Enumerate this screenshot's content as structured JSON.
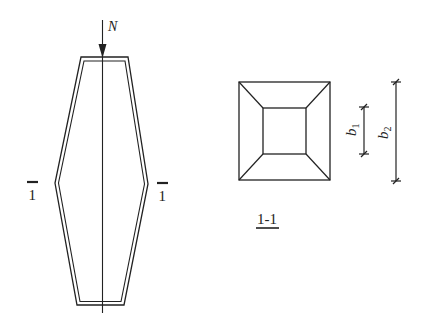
{
  "diagram": {
    "type": "structural-column-with-cross-section",
    "elevation": {
      "load_label": "N",
      "section_mark_left": "1",
      "section_mark_right": "1"
    },
    "section": {
      "title": "1-1",
      "dimensions": [
        {
          "label": "b",
          "subscript": "1",
          "describes": "inner square side"
        },
        {
          "label": "b",
          "subscript": "2",
          "describes": "outer square side"
        }
      ]
    },
    "colors": {
      "line": "#222222",
      "background": "#ffffff"
    }
  }
}
